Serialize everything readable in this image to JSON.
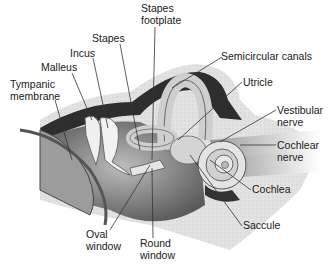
{
  "diagram": {
    "labels": [
      {
        "id": "stapes-footplate",
        "text": "Stapes\nfootplate",
        "x": 141,
        "y": 3
      },
      {
        "id": "semicircular-canals",
        "text": "Semicircular canals",
        "x": 221,
        "y": 51
      },
      {
        "id": "stapes",
        "text": "Stapes",
        "x": 92,
        "y": 33
      },
      {
        "id": "incus",
        "text": "Incus",
        "x": 70,
        "y": 48
      },
      {
        "id": "malleus",
        "text": "Malleus",
        "x": 41,
        "y": 62
      },
      {
        "id": "tympanic-membrane",
        "text": "Tympanic\nmembrane",
        "x": 10,
        "y": 79
      },
      {
        "id": "utricle",
        "text": "Utricle",
        "x": 243,
        "y": 77
      },
      {
        "id": "vestibular-nerve",
        "text": "Vestibular\nnerve",
        "x": 277,
        "y": 105
      },
      {
        "id": "cochlear-nerve",
        "text": "Cochlear\nnerve",
        "x": 277,
        "y": 140
      },
      {
        "id": "cochlea",
        "text": "Cochlea",
        "x": 252,
        "y": 184
      },
      {
        "id": "saccule",
        "text": "Saccule",
        "x": 243,
        "y": 220
      },
      {
        "id": "oval-window",
        "text": "Oval\nwindow",
        "x": 86,
        "y": 229
      },
      {
        "id": "round-window",
        "text": "Round\nwindow",
        "x": 140,
        "y": 238
      }
    ],
    "colors": {
      "line": "#333333",
      "bone": "#dcdcdc",
      "dark": "#3a3a3a",
      "mid": "#8a8a8a",
      "light": "#d8d8d8"
    }
  }
}
